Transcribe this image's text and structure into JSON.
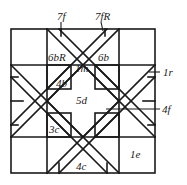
{
  "diagram": {
    "type": "crease-pattern",
    "labels": {
      "top_left_pointer": "7f",
      "top_right_pointer": "7fR",
      "upper_left_region": "6bR",
      "upper_right_region": "6b",
      "center_top_small": "1m",
      "left_small_triangle": "4b",
      "center": "5d",
      "right_pointer_upper": "1r",
      "right_pointer_lower": "4f",
      "lower_left_region": "3c",
      "bottom_center": "4c",
      "bottom_right_cell": "1e"
    },
    "colors": {
      "line": "#1a1a1a",
      "background": "#ffffff"
    }
  }
}
